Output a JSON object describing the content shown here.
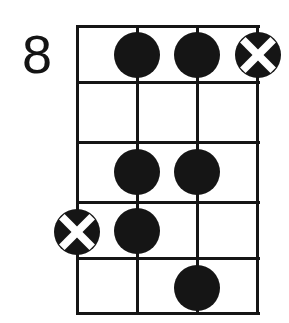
{
  "diagram": {
    "type": "guitar-chord-diagram",
    "title": "",
    "position_label": "8",
    "position_label_meaning": "starting fret number",
    "orientation": "vertical",
    "string_count": 4,
    "fret_count": 5,
    "colors": {
      "ink": "#151515",
      "background": "#ffffff",
      "marker_fill": "#151515",
      "marker_cross": "#ffffff"
    },
    "geometry": {
      "grid_left": 77,
      "grid_right": 258,
      "grid_top": 26,
      "grid_bottom": 313,
      "string_x": [
        77,
        137,
        197,
        258
      ],
      "fret_y": [
        26,
        82,
        142,
        202,
        258,
        313
      ],
      "line_width": 3,
      "marker_diameter": 46
    },
    "strings": [
      {
        "index": 1,
        "x": 77
      },
      {
        "index": 2,
        "x": 137
      },
      {
        "index": 3,
        "x": 197
      },
      {
        "index": 4,
        "x": 258
      }
    ],
    "frets": [
      {
        "index": 1,
        "top": 26,
        "bottom": 82
      },
      {
        "index": 2,
        "top": 82,
        "bottom": 142
      },
      {
        "index": 3,
        "top": 142,
        "bottom": 202
      },
      {
        "index": 4,
        "top": 202,
        "bottom": 258
      },
      {
        "index": 5,
        "top": 258,
        "bottom": 313
      }
    ],
    "markers": [
      {
        "id": "m1",
        "shape": "dot",
        "string": 2,
        "fret": 1,
        "cx": 137,
        "cy": 55,
        "d": 46
      },
      {
        "id": "m2",
        "shape": "dot",
        "string": 3,
        "fret": 1,
        "cx": 197,
        "cy": 55,
        "d": 46
      },
      {
        "id": "m3",
        "shape": "cross",
        "string": 4,
        "fret": 1,
        "cx": 258,
        "cy": 55,
        "d": 46
      },
      {
        "id": "m4",
        "shape": "dot",
        "string": 2,
        "fret": 3,
        "cx": 137,
        "cy": 172,
        "d": 46
      },
      {
        "id": "m5",
        "shape": "dot",
        "string": 3,
        "fret": 3,
        "cx": 197,
        "cy": 172,
        "d": 46
      },
      {
        "id": "m6",
        "shape": "cross",
        "string": 1,
        "fret": 4,
        "cx": 77,
        "cy": 232,
        "d": 46
      },
      {
        "id": "m7",
        "shape": "dot",
        "string": 2,
        "fret": 4,
        "cx": 137,
        "cy": 231,
        "d": 46
      },
      {
        "id": "m8",
        "shape": "dot",
        "string": 3,
        "fret": 5,
        "cx": 197,
        "cy": 288,
        "d": 46
      }
    ]
  }
}
